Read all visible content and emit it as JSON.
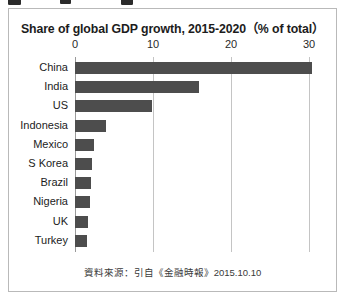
{
  "figure": {
    "title": "Share of global GDP growth, 2015-2020（% of total）",
    "source_note": "資料來源：引自《金融時報》2015.10.10"
  },
  "chart_data": {
    "type": "bar",
    "orientation": "horizontal",
    "title": "Share of global GDP growth, 2015-2020（% of total）",
    "xlabel": "",
    "ylabel": "",
    "xlim": [
      0,
      30
    ],
    "ticks": [
      0,
      10,
      20,
      30
    ],
    "tick_labels": [
      "0",
      "10",
      "20",
      "30"
    ],
    "grid": true,
    "legend": "none",
    "bar_color": "#4d4d4d",
    "categories": [
      "China",
      "India",
      "US",
      "Indonesia",
      "Mexico",
      "S Korea",
      "Brazil",
      "Nigeria",
      "UK",
      "Turkey"
    ],
    "values": [
      30.4,
      15.9,
      9.9,
      4.0,
      2.4,
      2.2,
      2.0,
      1.9,
      1.7,
      1.5
    ],
    "annotation": "資料來源：引自《金融時報》2015.10.10"
  }
}
